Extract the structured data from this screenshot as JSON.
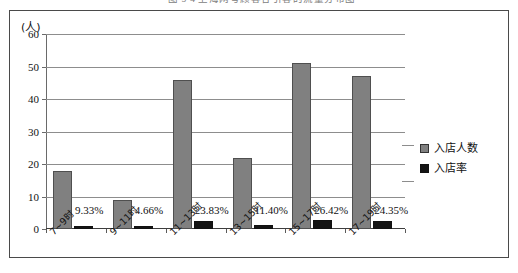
{
  "caption": {
    "text": "图 5-4  上海网号顾客各引客的流量分布图"
  },
  "chart_data": {
    "type": "bar",
    "title": "",
    "xlabel": "",
    "ylabel": "(人)",
    "ylim": [
      0,
      60
    ],
    "yticks": [
      0,
      10,
      20,
      30,
      40,
      50,
      60
    ],
    "ytick_labels": [
      "0",
      "10",
      "20",
      "30",
      "40",
      "50",
      "60"
    ],
    "grid": true,
    "legend_position": "right",
    "categories": [
      "7~9时",
      "9~11时",
      "11~13时",
      "13~15时",
      "15~17时",
      "17~19时"
    ],
    "series": [
      {
        "name": "入店人数",
        "color": "#808080",
        "values": [
          18,
          9,
          46,
          22,
          51,
          47
        ]
      },
      {
        "name": "入店率",
        "color": "#141414",
        "values": [
          0.9333,
          0.4666,
          2.383,
          1.14,
          2.642,
          2.435
        ],
        "data_labels": [
          "9.33%",
          "4.66%",
          "23.83%",
          "11.40%",
          "26.42%",
          "24.35%"
        ]
      }
    ]
  },
  "legend": {
    "items": [
      {
        "label": "入店人数",
        "swatch": "gray"
      },
      {
        "label": "入店率",
        "swatch": "black"
      }
    ]
  }
}
